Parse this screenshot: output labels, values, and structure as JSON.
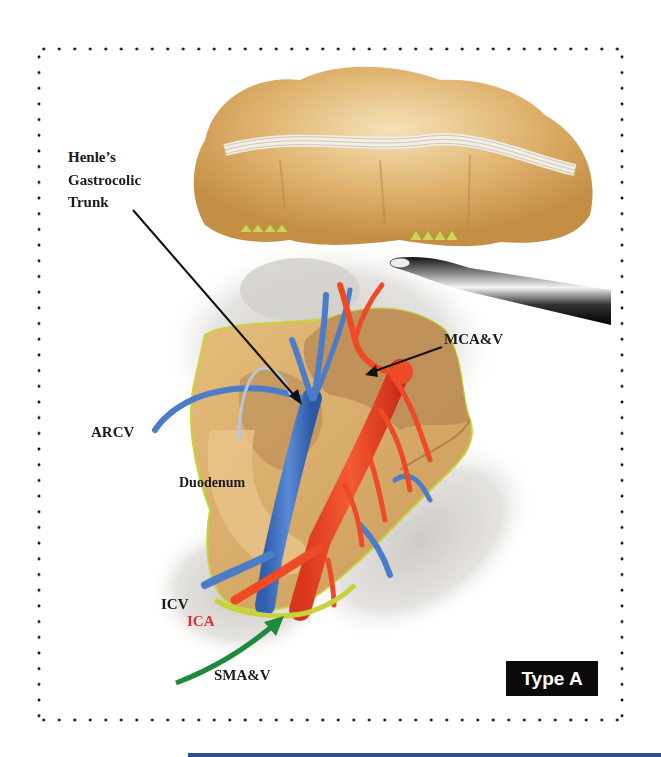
{
  "figure": {
    "type": "surgical anatomy illustration",
    "badge": "Type A",
    "labels": {
      "henle_line1": "Henle’s",
      "henle_line2": "Gastrocolic",
      "henle_line3": "Trunk",
      "mcav": "MCA&V",
      "arcv": "ARCV",
      "duodenum": "Duodenum",
      "icv": "ICV",
      "ica": "ICA",
      "smav": "SMA&V"
    },
    "colors": {
      "vein": "#4a7cc9",
      "artery": "#ee4a25",
      "tissue": "#d9a860",
      "pancreas": "#b98a55",
      "border_yellow": "#c8d23a",
      "green_arrow": "#1d8a3c",
      "badge_bg": "#0a0a0a",
      "bottom_bar": "#2d4f8a"
    }
  }
}
